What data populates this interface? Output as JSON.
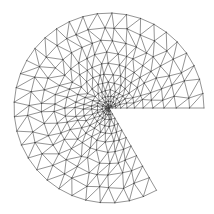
{
  "figure": {
    "background": "#ffffff",
    "line_color": "#3a3a3a",
    "line_width": 0.55,
    "center": [
      109,
      108
    ],
    "radius": 95,
    "start_angle_deg": 0,
    "end_angle_deg": 300,
    "rings": 12,
    "grading_exponent": 1.9,
    "outer_segments": 34
  }
}
